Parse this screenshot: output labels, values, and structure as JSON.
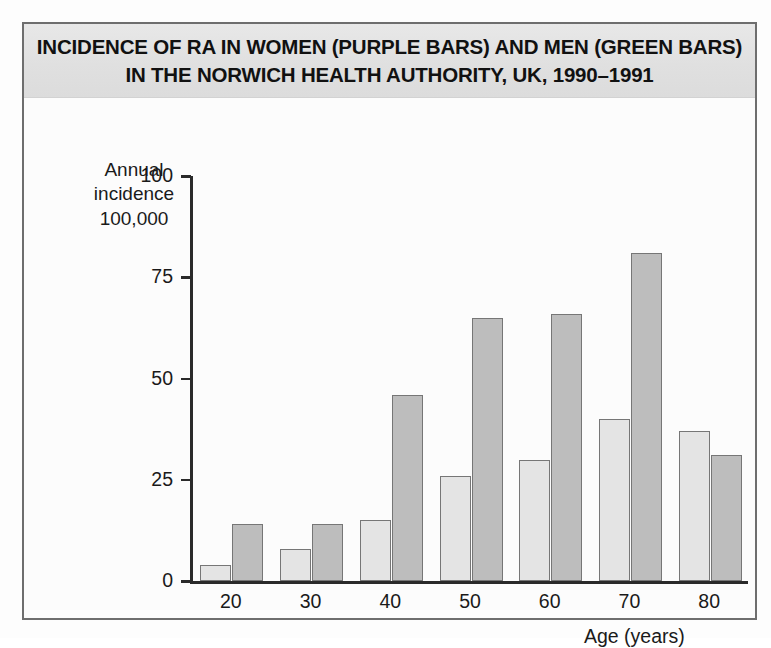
{
  "title": {
    "line1": "INCIDENCE OF RA IN WOMEN (PURPLE BARS) AND MEN (GREEN BARS)",
    "line2": "IN THE NORWICH HEALTH AUTHORITY, UK, 1990–1991"
  },
  "axis": {
    "y_label_line1": "Annual",
    "y_label_line2": "incidence",
    "y_label_line3": "100,000",
    "x_title": "Age (years)"
  },
  "colors": {
    "women_bar": "#e4e4e4",
    "men_bar": "#bdbdbd",
    "bar_outline": "#767676",
    "banner_bg": "#e2e2e2",
    "frame": "#6e6e6e",
    "text": "#111111"
  },
  "chart_data": {
    "type": "bar",
    "title": "INCIDENCE OF RA IN WOMEN (PURPLE BARS) AND MEN (GREEN BARS) IN THE NORWICH HEALTH AUTHORITY, UK, 1990–1991",
    "xlabel": "Age (years)",
    "ylabel": "Annual incidence 100,000",
    "categories": [
      "20",
      "30",
      "40",
      "50",
      "60",
      "70",
      "80"
    ],
    "series": [
      {
        "name": "Women (purple bars)",
        "values": [
          4,
          8,
          15,
          26,
          30,
          40,
          37
        ]
      },
      {
        "name": "Men (green bars)",
        "values": [
          14,
          14,
          46,
          65,
          66,
          81,
          31
        ]
      }
    ],
    "ylim": [
      0,
      100
    ],
    "yticks": [
      0,
      25,
      50,
      75,
      100
    ],
    "ytick_labels": [
      "0",
      "25",
      "50",
      "75",
      "100"
    ],
    "xtick_labels": [
      "20",
      "30",
      "40",
      "50",
      "60",
      "70",
      "80"
    ],
    "grid": false,
    "legend": "none (described in title)"
  }
}
